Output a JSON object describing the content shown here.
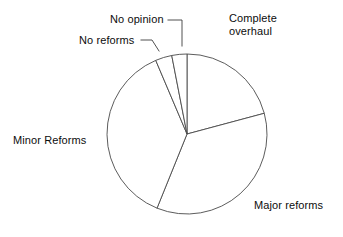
{
  "chart_data": {
    "type": "pie",
    "title": "",
    "subtitle": "",
    "xlabel": "",
    "ylabel": "",
    "legend_position": "none",
    "grid": false,
    "labels_position": "outside-with-leader-lines",
    "start_angle_deg": 0,
    "direction": "clockwise",
    "center": {
      "x": 187,
      "y": 134
    },
    "radius": 80,
    "stroke_color": "#4a4a4a",
    "fill_color": "#ffffff",
    "categories": [
      "Complete overhaul",
      "Major reforms",
      "Minor Reforms",
      "No reforms",
      "No opinion"
    ],
    "values": [
      20.8,
      35.3,
      37.5,
      3.3,
      3.1
    ],
    "slices": [
      {
        "label": "Complete overhaul",
        "value": 20.8,
        "start_angle_deg": 0,
        "end_angle_deg": 75
      },
      {
        "label": "Major reforms",
        "value": 35.3,
        "start_angle_deg": 75,
        "end_angle_deg": 202
      },
      {
        "label": "Minor Reforms",
        "value": 37.5,
        "start_angle_deg": 202,
        "end_angle_deg": 337
      },
      {
        "label": "No reforms",
        "value": 3.3,
        "start_angle_deg": 337,
        "end_angle_deg": 349
      },
      {
        "label": "No opinion",
        "value": 3.1,
        "start_angle_deg": 349,
        "end_angle_deg": 360
      }
    ]
  },
  "labels": {
    "complete_overhaul": "Complete\noverhaul",
    "major_reforms": "Major reforms",
    "minor_reforms": "Minor Reforms",
    "no_reforms": "No reforms",
    "no_opinion": "No opinion"
  }
}
